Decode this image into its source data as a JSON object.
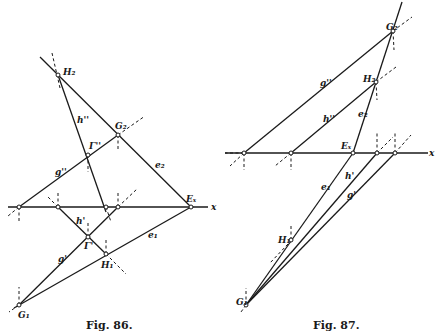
{
  "figures": [
    {
      "caption": "Fig. 86.",
      "labels": {
        "H2": "H₂",
        "h2": "h''",
        "G2": "G₂",
        "e2": "e₂",
        "Gamma2": "Γ''",
        "g2": "g''",
        "Ex": "Eₓ",
        "x": "x",
        "h1": "h'",
        "Gamma1": "Γ'",
        "g1": "g'",
        "e1": "e₁",
        "H1": "H₁",
        "G1": "G₁"
      }
    },
    {
      "caption": "Fig. 87.",
      "labels": {
        "G2": "G₂",
        "g2": "g''",
        "H2": "H₂",
        "h2": "h''",
        "e2": "e₂",
        "Ex": "Eₓ",
        "x": "x",
        "e1": "e₁",
        "h1": "h'",
        "g1": "g'",
        "H1": "H₁",
        "G1": "G₁"
      }
    }
  ]
}
